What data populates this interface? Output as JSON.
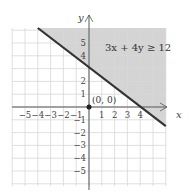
{
  "chart_data": {
    "type": "line",
    "title": "",
    "xlabel": "x",
    "ylabel": "y",
    "xlim": [
      -6,
      6
    ],
    "ylim": [
      -6,
      6
    ],
    "grid": true,
    "x_ticks": [
      "-5",
      "-4",
      "-3",
      "-2",
      "-1",
      "1",
      "2",
      "3",
      "4"
    ],
    "y_ticks": [
      "5",
      "4",
      "2",
      "1",
      "-1",
      "-2",
      "-3",
      "-4",
      "-5"
    ],
    "boundary_line": {
      "equation": "3x + 4y = 12",
      "points": [
        [
          -4,
          6
        ],
        [
          6,
          -1.5
        ]
      ],
      "style": "solid"
    },
    "shaded_region": "above line (3x + 4y >= 12)",
    "annotation": "3x + 4y ≥ 12",
    "test_point": {
      "label": "(0, 0)",
      "x": 0,
      "y": 0
    },
    "colors": {
      "shade": "#d4d4d4",
      "grid": "#d8d8d8",
      "line": "#333333",
      "axis": "#555555"
    }
  }
}
